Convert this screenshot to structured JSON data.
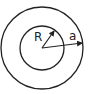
{
  "diagram": {
    "title": "",
    "type": "concentric-circles",
    "center": {
      "x": 42,
      "y": 48
    },
    "outer_circle": {
      "radius": 41,
      "label": "a"
    },
    "inner_circle": {
      "radius": 22,
      "label": "R"
    },
    "labels": {
      "inner_radius": "R",
      "outer_radius": "a"
    },
    "colors": {
      "stroke": "#222222",
      "background": "#ffffff"
    }
  }
}
